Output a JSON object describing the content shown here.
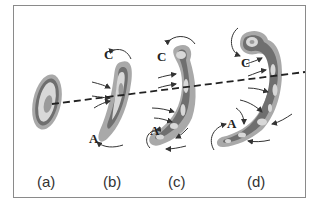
{
  "figure": {
    "panels": [
      {
        "id": "a",
        "label": "(a)"
      },
      {
        "id": "b",
        "label": "(b)",
        "markers": {
          "top": "C",
          "bottom": "A"
        }
      },
      {
        "id": "c",
        "label": "(c)",
        "markers": {
          "top": "C",
          "bottom": "A"
        }
      },
      {
        "id": "d",
        "label": "(d)",
        "markers": {
          "top": "C",
          "bottom": "A"
        }
      }
    ],
    "reference_line": "dashed",
    "colors": {
      "outer": "#a9a9a9",
      "ring": "#6f6f6f",
      "inner": "#d8d8d8",
      "core": "#9a9a9a",
      "arrow": "#333333",
      "frame": "#8a8a8a"
    }
  }
}
